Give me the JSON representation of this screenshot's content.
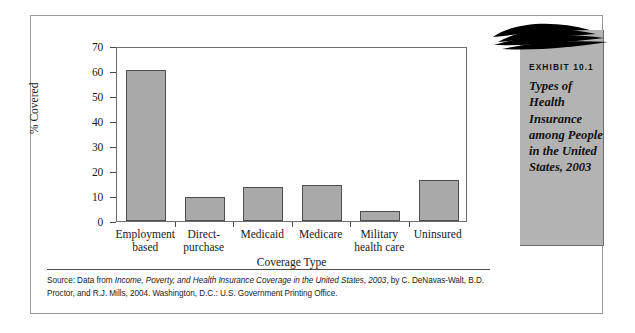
{
  "figure": {
    "exhibit_number": "EXHIBIT 10.1",
    "exhibit_title_lines": [
      "Types of",
      "Health",
      "Insurance",
      "among People",
      "in the United",
      "States, 2003"
    ],
    "panel_color": "#b3b3b3",
    "swoosh_color": "#000000"
  },
  "chart_data": {
    "type": "bar",
    "title": "",
    "xlabel": "Coverage Type",
    "ylabel": "% Covered",
    "ylim": [
      0,
      70
    ],
    "yticks": [
      0,
      10,
      20,
      30,
      40,
      50,
      60,
      70
    ],
    "grid": false,
    "legend": "none",
    "bar_color": "#a9a9a9",
    "bar_edge_color": "#4d4d4d",
    "categories": [
      "Employment-based",
      "Direct-purchase",
      "Medicaid",
      "Medicare",
      "Military health care",
      "Uninsured"
    ],
    "category_label_lines": [
      [
        "Employment",
        "based"
      ],
      [
        "Direct-",
        "purchase"
      ],
      [
        "Medicaid"
      ],
      [
        "Medicare"
      ],
      [
        "Military",
        "health care"
      ],
      [
        "Uninsured"
      ]
    ],
    "values": [
      60.5,
      9.5,
      13.5,
      14.5,
      4.0,
      16.5
    ]
  },
  "source": {
    "line1_prefix": "Source: Data from ",
    "line1_italic": "Income, Poverty, and Health Insurance Coverage in the United States, 2003",
    "line1_suffix": ", by",
    "line2": "C. DeNavas-Walt, B.D. Proctor, and R.J. Mills, 2004. Washington, D.C.: U.S. Government Printing Office."
  }
}
